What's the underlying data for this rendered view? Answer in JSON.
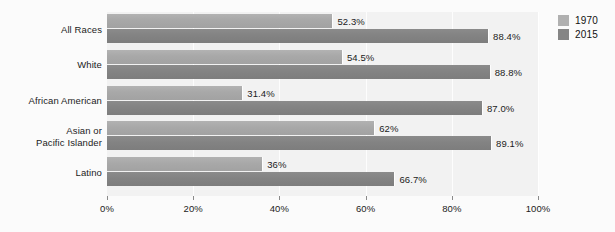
{
  "chart_data": {
    "type": "bar",
    "orientation": "horizontal",
    "title": "",
    "subtitle": "",
    "xlabel": "",
    "ylabel": "",
    "xlim": [
      0,
      100
    ],
    "grid": true,
    "legend_position": "right",
    "categories": [
      "All Races",
      "White",
      "African American",
      "Asian or\nPacific Islander",
      "Latino"
    ],
    "tick_labels": [
      "0%",
      "20%",
      "40%",
      "60%",
      "80%",
      "100%"
    ],
    "tick_values": [
      0,
      20,
      40,
      60,
      80,
      100
    ],
    "series": [
      {
        "name": "1970",
        "color": "#a8a8a8",
        "values": [
          52.3,
          54.5,
          31.4,
          62,
          36
        ],
        "labels": [
          "52.3%",
          "54.5%",
          "31.4%",
          "62%",
          "36%"
        ]
      },
      {
        "name": "2015",
        "color": "#838383",
        "values": [
          88.4,
          88.8,
          87.0,
          89.1,
          66.7
        ],
        "labels": [
          "88.4%",
          "88.8%",
          "87.0%",
          "89.1%",
          "66.7%"
        ]
      }
    ]
  },
  "categories": [
    {
      "line1": "All Races",
      "line2": ""
    },
    {
      "line1": "White",
      "line2": ""
    },
    {
      "line1": "African American",
      "line2": ""
    },
    {
      "line1": "Asian or",
      "line2": "Pacific Islander"
    },
    {
      "line1": "Latino",
      "line2": ""
    }
  ],
  "legend": {
    "items": [
      {
        "label": "1970",
        "color": "#b0b0b0"
      },
      {
        "label": "2015",
        "color": "#858585"
      }
    ]
  },
  "axis": {
    "ticks": [
      {
        "label": "0%",
        "value": 0
      },
      {
        "label": "20%",
        "value": 20
      },
      {
        "label": "40%",
        "value": 40
      },
      {
        "label": "60%",
        "value": 60
      },
      {
        "label": "80%",
        "value": 80
      },
      {
        "label": "100%",
        "value": 100
      }
    ]
  },
  "colors": {
    "panel_background": "#f2f2f2",
    "figure_background": "#fbfbfb",
    "series_1970": "#a8a8a8",
    "series_2015": "#838383",
    "text": "#1b1b1b",
    "gridline": "#ffffff"
  }
}
